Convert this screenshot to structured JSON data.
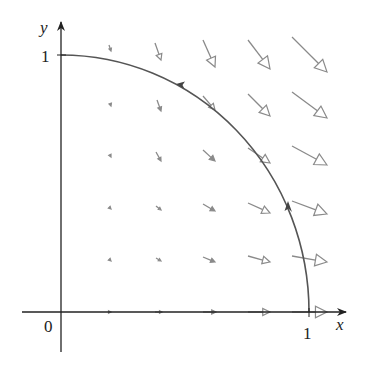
{
  "figure": {
    "x_axis_label": "x",
    "y_axis_label": "y",
    "origin_label": "0",
    "x_tick_label": "1",
    "y_tick_label": "1"
  },
  "colors": {
    "axis": "#222222",
    "curve": "#555555",
    "field_arrow": "#8a8a8a"
  },
  "chart_data": {
    "type": "vector_field",
    "title": "",
    "xlabel": "x",
    "ylabel": "y",
    "xlim": [
      0,
      1
    ],
    "ylim": [
      0,
      1
    ],
    "ticks": {
      "x": [
        "0",
        "1"
      ],
      "y": [
        "1"
      ]
    },
    "grid_points_x": [
      0.2,
      0.4,
      0.6,
      0.8,
      1.0
    ],
    "grid_points_y": [
      0.0,
      0.2,
      0.4,
      0.6,
      0.8,
      1.0
    ],
    "curve": {
      "description": "quarter unit circle from (1,0) to (0,1), counterclockwise orientation",
      "direction_arrows_at": [
        [
          0.92,
          0.39
        ],
        [
          0.6,
          0.8
        ]
      ]
    },
    "arrows_px": [
      {
        "tail": [
          109,
          45
        ],
        "head": [
          111,
          51
        ]
      },
      {
        "tail": [
          155,
          43
        ],
        "head": [
          161,
          60
        ]
      },
      {
        "tail": [
          203,
          40
        ],
        "head": [
          215,
          67
        ]
      },
      {
        "tail": [
          248,
          40
        ],
        "head": [
          270,
          69
        ]
      },
      {
        "tail": [
          292,
          37
        ],
        "head": [
          327,
          72
        ]
      },
      {
        "tail": [
          110,
          103
        ],
        "head": [
          111,
          106
        ]
      },
      {
        "tail": [
          157,
          100
        ],
        "head": [
          161,
          111
        ]
      },
      {
        "tail": [
          203,
          96
        ],
        "head": [
          215,
          110
        ]
      },
      {
        "tail": [
          248,
          94
        ],
        "head": [
          270,
          116
        ]
      },
      {
        "tail": [
          292,
          92
        ],
        "head": [
          327,
          118
        ]
      },
      {
        "tail": [
          110,
          155
        ],
        "head": [
          111,
          157
        ]
      },
      {
        "tail": [
          156,
          152
        ],
        "head": [
          161,
          161
        ]
      },
      {
        "tail": [
          203,
          150
        ],
        "head": [
          215,
          161
        ]
      },
      {
        "tail": [
          248,
          148
        ],
        "head": [
          270,
          163
        ]
      },
      {
        "tail": [
          292,
          146
        ],
        "head": [
          327,
          165
        ]
      },
      {
        "tail": [
          110,
          208
        ],
        "head": [
          111,
          209
        ]
      },
      {
        "tail": [
          156,
          206
        ],
        "head": [
          161,
          210
        ]
      },
      {
        "tail": [
          203,
          204
        ],
        "head": [
          215,
          211
        ]
      },
      {
        "tail": [
          248,
          203
        ],
        "head": [
          270,
          213
        ]
      },
      {
        "tail": [
          292,
          201
        ],
        "head": [
          327,
          214
        ]
      },
      {
        "tail": [
          110,
          260
        ],
        "head": [
          111,
          261
        ]
      },
      {
        "tail": [
          156,
          258
        ],
        "head": [
          161,
          261
        ]
      },
      {
        "tail": [
          203,
          257
        ],
        "head": [
          215,
          262
        ]
      },
      {
        "tail": [
          248,
          256
        ],
        "head": [
          270,
          262
        ]
      },
      {
        "tail": [
          292,
          256
        ],
        "head": [
          327,
          262
        ]
      },
      {
        "tail": [
          109,
          312
        ],
        "head": [
          111,
          312
        ]
      },
      {
        "tail": [
          155,
          312
        ],
        "head": [
          162,
          312
        ]
      },
      {
        "tail": [
          203,
          312
        ],
        "head": [
          216,
          312
        ]
      },
      {
        "tail": [
          248,
          312
        ],
        "head": [
          270,
          312
        ]
      },
      {
        "tail": [
          292,
          312
        ],
        "head": [
          327,
          312
        ]
      }
    ]
  }
}
